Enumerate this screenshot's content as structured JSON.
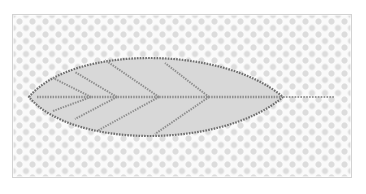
{
  "page": {
    "background_color": "#ffffff",
    "width": 366,
    "height": 194
  },
  "panel": {
    "name": "image-preview-panel",
    "border_color": "#d2d2d2",
    "background_color": "#fafafa",
    "x": 12,
    "y": 14,
    "width": 340,
    "height": 164
  },
  "transparency_backdrop": {
    "pattern": "dot-grid",
    "dot_color": "#dcdcdc",
    "base_color": "#fafafa",
    "cell_size_px": 13,
    "dot_radius_px": 3
  },
  "artwork": {
    "name": "leaf-icon",
    "description": "Leaf outline with midrib and branching veins, drawn with dashed strokes",
    "fill_color": "#d8d8d8",
    "outline_color": "#6e6e6e",
    "vein_color": "#8f8f8f",
    "stem_color": "#9a9a9a",
    "stroke_style": "dashed",
    "outline_width_px": 2.2,
    "vein_width_px": 2.0,
    "stem_width_px": 2.2,
    "blade": {
      "left_tip_x": 16,
      "right_tip_x": 270,
      "center_y": 82,
      "max_half_height": 52
    },
    "midrib": {
      "x_start": 24,
      "x_end": 268,
      "y": 82
    },
    "stem": {
      "x_start": 270,
      "x_end": 322,
      "y": 82
    },
    "veins_upper": [
      {
        "from_x": 196,
        "from_y": 82,
        "to_x": 152,
        "to_y": 48
      },
      {
        "from_x": 146,
        "from_y": 82,
        "to_x": 92,
        "to_y": 45
      },
      {
        "from_x": 104,
        "from_y": 82,
        "to_x": 62,
        "to_y": 57
      },
      {
        "from_x": 78,
        "from_y": 82,
        "to_x": 40,
        "to_y": 63
      }
    ],
    "veins_lower": [
      {
        "from_x": 196,
        "from_y": 82,
        "to_x": 142,
        "to_y": 119
      },
      {
        "from_x": 146,
        "from_y": 82,
        "to_x": 84,
        "to_y": 116
      },
      {
        "from_x": 104,
        "from_y": 82,
        "to_x": 62,
        "to_y": 104
      },
      {
        "from_x": 78,
        "from_y": 82,
        "to_x": 40,
        "to_y": 96
      }
    ]
  }
}
